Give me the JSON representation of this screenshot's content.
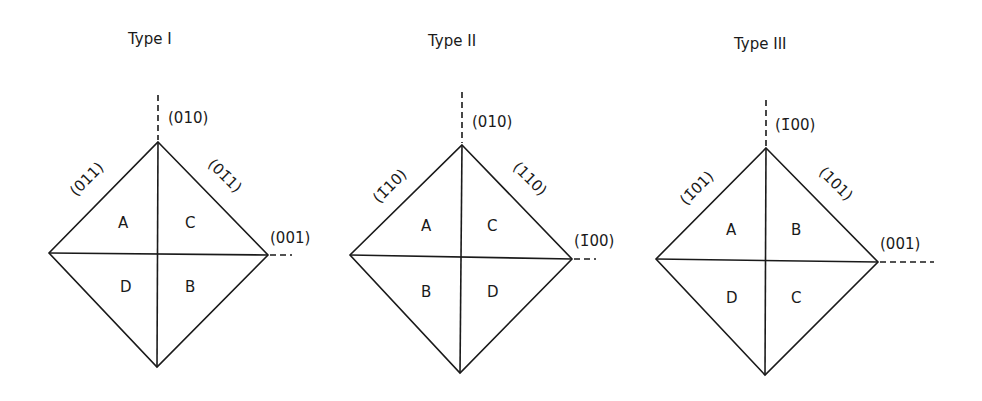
{
  "figure": {
    "panels": [
      {
        "title": "Type I",
        "pole_top": "(010)",
        "pole_right": "(001)",
        "edge_upper_left": "(011)",
        "edge_upper_right": "(01̄1)",
        "regions": {
          "upper_left": "A",
          "upper_right": "C",
          "lower_left": "D",
          "lower_right": "B"
        }
      },
      {
        "title": "Type II",
        "pole_top": "(010)",
        "pole_right": "(1̄00)",
        "edge_upper_left": "(1̄10)",
        "edge_upper_right": "(110)",
        "regions": {
          "upper_left": "A",
          "upper_right": "C",
          "lower_left": "B",
          "lower_right": "D"
        }
      },
      {
        "title": "Type III",
        "pole_top": "(1̄00)",
        "pole_right": "(001)",
        "edge_upper_left": "(1̄01)",
        "edge_upper_right": "(101)",
        "regions": {
          "upper_left": "A",
          "upper_right": "B",
          "lower_left": "D",
          "lower_right": "C"
        }
      }
    ]
  }
}
